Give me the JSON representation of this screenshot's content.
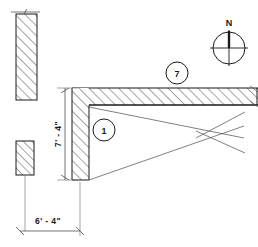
{
  "drawing": {
    "title": "Architectural Wall Section Detail",
    "background_color": "#ffffff",
    "line_color": "#1a1a1a",
    "thin_line_color": "#4a4a4a",
    "dimensions": {
      "vertical": {
        "label": "7' - 4\"",
        "orientation": "vertical",
        "feet": 7,
        "inches": 4
      },
      "horizontal": {
        "label": "6' - 4\"",
        "orientation": "horizontal",
        "feet": 6,
        "inches": 4
      }
    },
    "callouts": [
      {
        "id": "callout-1",
        "label": "1",
        "description": "wall-corner-detail-tag"
      },
      {
        "id": "callout-7",
        "label": "7",
        "description": "beam-detail-tag"
      }
    ],
    "compass": {
      "label": "N",
      "name": "north-arrow"
    },
    "elements": {
      "upper_left_wall_label": "upper-left-wall-section",
      "lower_left_wall_label": "lower-left-wall-section",
      "vertical_wall_label": "vertical-wall-leg",
      "horizontal_beam_label": "horizontal-beam",
      "bracing_label": "diagonal-bracing-lines"
    }
  }
}
